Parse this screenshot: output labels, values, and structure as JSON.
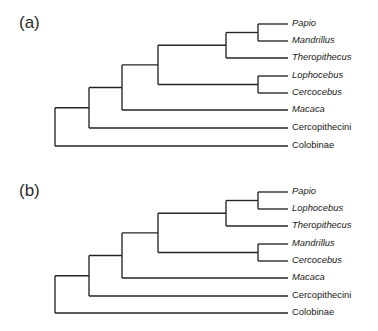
{
  "figure": {
    "background": "#ffffff",
    "line_color": "#242424",
    "text_color": "#1a1a1a",
    "width": 378,
    "height": 331
  },
  "panels": [
    {
      "id": "panel-a",
      "letter": "(a)",
      "letter_x": 19,
      "letter_y": 28,
      "tip_x": 288,
      "label_x": 292,
      "root_x": 55,
      "tips": [
        {
          "name": "Papio",
          "italic": true,
          "y": 24
        },
        {
          "name": "Mandrillus",
          "italic": true,
          "y": 41
        },
        {
          "name": "Theropithecus",
          "italic": true,
          "y": 58
        },
        {
          "name": "Lophocebus",
          "italic": true,
          "y": 76
        },
        {
          "name": "Cercocebus",
          "italic": true,
          "y": 93
        },
        {
          "name": "Macaca",
          "italic": true,
          "y": 110
        },
        {
          "name": "Cercopithecini",
          "italic": false,
          "y": 128
        },
        {
          "name": "Colobinae",
          "italic": false,
          "y": 146
        }
      ],
      "nodes": [
        {
          "id": "n-papio-mandrillus",
          "x": 258,
          "children_y": [
            24,
            41
          ]
        },
        {
          "id": "n-papionina",
          "x": 226,
          "children_y": [
            32.5,
            58
          ]
        },
        {
          "id": "n-lopho-cerco",
          "x": 258,
          "children_y": [
            76,
            93
          ]
        },
        {
          "id": "n-papionini",
          "x": 158,
          "children_y": [
            45.25,
            84.5
          ]
        },
        {
          "id": "n-macaca-split",
          "x": 122,
          "children_y": [
            64.9,
            110
          ]
        },
        {
          "id": "n-cercopithecini",
          "x": 89,
          "children_y": [
            87.4,
            128
          ]
        },
        {
          "id": "n-root",
          "x": 55,
          "children_y": [
            107.7,
            146
          ]
        }
      ]
    },
    {
      "id": "panel-b",
      "letter": "(b)",
      "letter_x": 19,
      "letter_y": 196,
      "tip_x": 288,
      "label_x": 292,
      "root_x": 55,
      "tips": [
        {
          "name": "Papio",
          "italic": true,
          "y": 192
        },
        {
          "name": "Lophocebus",
          "italic": true,
          "y": 209
        },
        {
          "name": "Theropithecus",
          "italic": true,
          "y": 226
        },
        {
          "name": "Mandrillus",
          "italic": true,
          "y": 244
        },
        {
          "name": "Cercocebus",
          "italic": true,
          "y": 261
        },
        {
          "name": "Macaca",
          "italic": true,
          "y": 278
        },
        {
          "name": "Cercopithecini",
          "italic": false,
          "y": 296
        },
        {
          "name": "Colobinae",
          "italic": false,
          "y": 313
        }
      ],
      "nodes": [
        {
          "id": "n-papio-lophocebus",
          "x": 258,
          "children_y": [
            192,
            209
          ]
        },
        {
          "id": "n-papionina",
          "x": 226,
          "children_y": [
            200.5,
            226
          ]
        },
        {
          "id": "n-mandr-cerco",
          "x": 258,
          "children_y": [
            244,
            261
          ]
        },
        {
          "id": "n-papionini",
          "x": 158,
          "children_y": [
            213.25,
            252.5
          ]
        },
        {
          "id": "n-macaca-split",
          "x": 122,
          "children_y": [
            232.9,
            278
          ]
        },
        {
          "id": "n-cercopithecini",
          "x": 89,
          "children_y": [
            255.4,
            296
          ]
        },
        {
          "id": "n-root",
          "x": 55,
          "children_y": [
            275.7,
            313
          ]
        }
      ]
    }
  ]
}
